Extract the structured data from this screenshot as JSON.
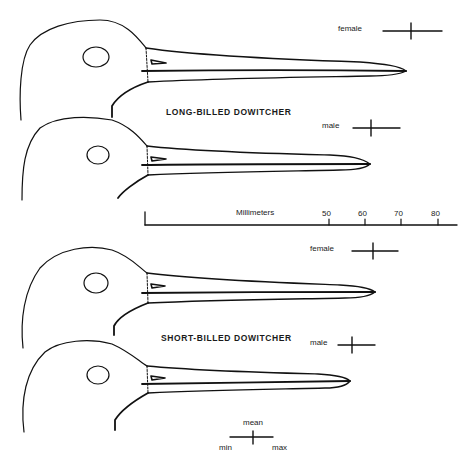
{
  "figure": {
    "species": [
      {
        "name": "LONG-BILLED DOWITCHER",
        "birds": [
          {
            "sex": "female",
            "bill_mm": {
              "min": 65,
              "mean": 72.5,
              "max": 81
            }
          },
          {
            "sex": "male",
            "bill_mm": {
              "min": 56.5,
              "mean": 61.5,
              "max": 69.5
            }
          }
        ]
      },
      {
        "name": "SHORT-BILLED DOWITCHER",
        "birds": [
          {
            "sex": "female",
            "bill_mm": {
              "min": 56,
              "mean": 62,
              "max": 69
            }
          },
          {
            "sex": "male",
            "bill_mm": {
              "min": 52.5,
              "mean": 56,
              "max": 62.5
            }
          }
        ]
      }
    ],
    "scale": {
      "label": "Millimeters",
      "ticks": [
        "50",
        "60",
        "70",
        "80"
      ]
    },
    "legend": {
      "mean": "mean",
      "min": "min",
      "max": "max"
    },
    "line_color": "#111111",
    "background": "#ffffff"
  }
}
